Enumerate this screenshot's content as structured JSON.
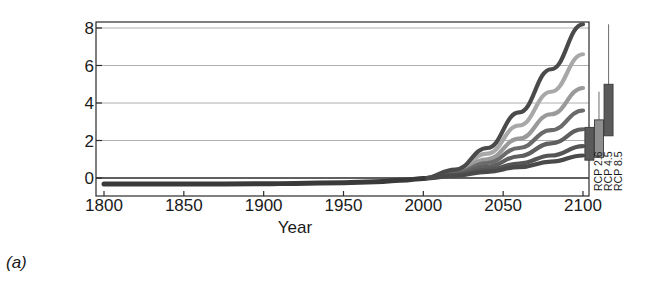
{
  "panel": {
    "label": "(a)"
  },
  "axes": {
    "ylabel": "Global mean\nsea level (feet)",
    "xlabel": "Year",
    "yticks": [
      "0",
      "2",
      "4",
      "6",
      "8"
    ],
    "xticks": [
      "1800",
      "1850",
      "1900",
      "1950",
      "2000",
      "2050",
      "2100"
    ]
  },
  "colors": {
    "frame": "#2b2b2b",
    "grid": "#8c8c8c",
    "historical": "#3a3a3a",
    "curve_dark": "#4a4a4a",
    "curve_mid": "#6e6e6e",
    "curve_light": "#a8a8a8",
    "box_fill_dark": "#5a5a5a",
    "box_fill_light": "#8e8e8e",
    "whisker": "#7a7a7a"
  },
  "chart_data": {
    "type": "line",
    "title": "",
    "xlabel": "Year",
    "ylabel": "Global mean sea level (feet)",
    "xlim": [
      1800,
      2120
    ],
    "ylim": [
      -1.05,
      8.6
    ],
    "ytick_values": [
      0,
      2,
      4,
      6,
      8
    ],
    "xtick_values": [
      1800,
      1850,
      1900,
      1950,
      2000,
      2050,
      2100
    ],
    "grid": "horizontal",
    "legend": "none",
    "zero_reference_line": 0,
    "historical": {
      "name": "Observed / historical",
      "x": [
        1800,
        1850,
        1900,
        1920,
        1950,
        1970,
        1990,
        2000
      ],
      "y": [
        -0.32,
        -0.32,
        -0.31,
        -0.29,
        -0.25,
        -0.2,
        -0.1,
        -0.02
      ]
    },
    "series": [
      {
        "name": "Scenario 1 (lowest)",
        "color": "#4a4a4a",
        "x": [
          2000,
          2020,
          2040,
          2060,
          2080,
          2100
        ],
        "y": [
          -0.02,
          0.12,
          0.33,
          0.58,
          0.87,
          1.2
        ]
      },
      {
        "name": "Scenario 2",
        "color": "#555555",
        "x": [
          2000,
          2020,
          2040,
          2060,
          2080,
          2100
        ],
        "y": [
          -0.02,
          0.16,
          0.43,
          0.77,
          1.2,
          1.7
        ]
      },
      {
        "name": "Scenario 3",
        "color": "#5f5f5f",
        "x": [
          2000,
          2020,
          2040,
          2060,
          2080,
          2100
        ],
        "y": [
          -0.02,
          0.2,
          0.6,
          1.16,
          1.85,
          2.6
        ]
      },
      {
        "name": "Scenario 4",
        "color": "#6b6b6b",
        "x": [
          2000,
          2020,
          2040,
          2060,
          2080,
          2100
        ],
        "y": [
          -0.02,
          0.25,
          0.8,
          1.6,
          2.55,
          3.6
        ]
      },
      {
        "name": "Scenario 5",
        "color": "#9a9a9a",
        "x": [
          2000,
          2020,
          2040,
          2060,
          2080,
          2100
        ],
        "y": [
          -0.02,
          0.3,
          1.0,
          2.1,
          3.4,
          4.8
        ]
      },
      {
        "name": "Scenario 6",
        "color": "#a8a8a8",
        "x": [
          2000,
          2020,
          2040,
          2060,
          2080,
          2100
        ],
        "y": [
          -0.02,
          0.38,
          1.3,
          2.8,
          4.6,
          6.6
        ]
      },
      {
        "name": "Scenario 7 (highest)",
        "color": "#4a4a4a",
        "x": [
          2000,
          2020,
          2040,
          2060,
          2080,
          2100
        ],
        "y": [
          -0.02,
          0.45,
          1.6,
          3.5,
          5.8,
          8.2
        ]
      }
    ],
    "boxplots": [
      {
        "label": "RCP 2.6",
        "x_position": 2104,
        "box_low": 0.95,
        "box_high": 2.7,
        "whisker_high": 2.9,
        "whisker_low": 0.95,
        "fill": "#5a5a5a"
      },
      {
        "label": "RCP 4.5",
        "x_position": 2110,
        "box_low": 1.1,
        "box_high": 3.1,
        "whisker_high": 4.6,
        "whisker_low": 1.1,
        "fill": "#8e8e8e"
      },
      {
        "label": "RCP 8.5",
        "x_position": 2116,
        "box_low": 2.25,
        "box_high": 5.0,
        "whisker_high": 8.2,
        "whisker_low": 2.25,
        "fill": "#5a5a5a"
      }
    ]
  }
}
